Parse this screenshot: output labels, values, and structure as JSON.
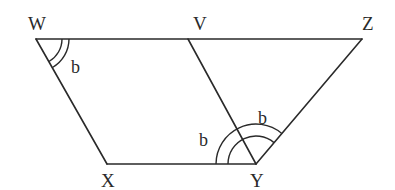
{
  "figure": {
    "type": "geometry",
    "colors": {
      "line": "#2a2a2a",
      "background": "#ffffff"
    }
  },
  "vertices": {
    "W": {
      "label": "W",
      "x": 36,
      "y": 39
    },
    "V": {
      "label": "V",
      "x": 188,
      "y": 39
    },
    "Z": {
      "label": "Z",
      "x": 362,
      "y": 39
    },
    "X": {
      "label": "X",
      "x": 107,
      "y": 164
    },
    "Y": {
      "label": "Y",
      "x": 256,
      "y": 164
    }
  },
  "segments": [
    [
      "W",
      "Z"
    ],
    [
      "W",
      "X"
    ],
    [
      "X",
      "Y"
    ],
    [
      "V",
      "Y"
    ],
    [
      "Y",
      "Z"
    ]
  ],
  "angle_labels": {
    "angle_W": "b",
    "angle_VYX_lower": "b",
    "angle_XYZ_upper": "b"
  }
}
